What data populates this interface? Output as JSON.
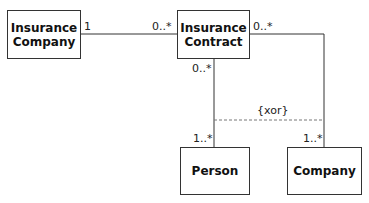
{
  "classes": {
    "insurance_company": "Insurance Company",
    "insurance_contract": "Insurance Contract",
    "person": "Person",
    "company": "Company"
  },
  "associations": {
    "company_contract": {
      "company_end": "1",
      "contract_end": "0..*"
    },
    "contract_company": {
      "contract_end": "0..*",
      "company_end": "1..*"
    },
    "contract_person": {
      "contract_end": "0..*",
      "person_end": "1..*"
    }
  },
  "constraint": "{xor}",
  "colors": {
    "line": "#333333",
    "dashed": "#777777"
  }
}
